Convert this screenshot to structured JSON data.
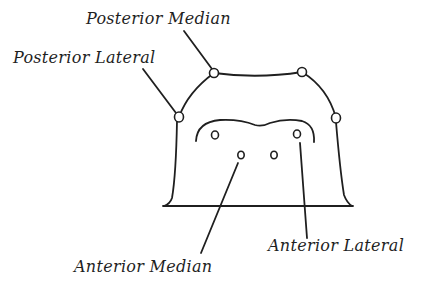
{
  "diagram": {
    "labels": {
      "posterior_median": "Posterior Median",
      "posterior_lateral": "Posterior Lateral",
      "anterior_median": "Anterior Median",
      "anterior_lateral": "Anterior Lateral"
    },
    "colors": {
      "stroke": "#1f1f1f",
      "background": "#ffffff"
    },
    "eyes": [
      {
        "name": "posterior-lateral-left",
        "x": 179,
        "y": 117
      },
      {
        "name": "posterior-median-left",
        "x": 214,
        "y": 73
      },
      {
        "name": "posterior-median-right",
        "x": 302,
        "y": 72
      },
      {
        "name": "posterior-lateral-right",
        "x": 336,
        "y": 118
      },
      {
        "name": "anterior-lateral-left",
        "x": 215,
        "y": 135
      },
      {
        "name": "anterior-median-left",
        "x": 241,
        "y": 155
      },
      {
        "name": "anterior-median-right",
        "x": 274,
        "y": 155
      },
      {
        "name": "anterior-lateral-right",
        "x": 297,
        "y": 134
      }
    ]
  }
}
